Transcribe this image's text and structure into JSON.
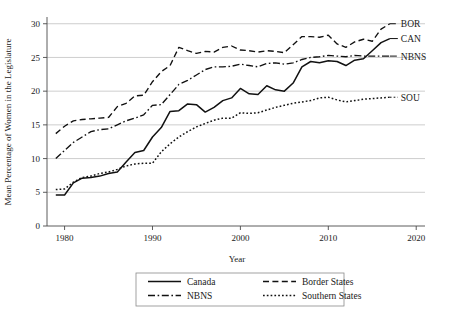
{
  "chart_data": {
    "type": "line",
    "title": "",
    "xlabel": "Year",
    "ylabel": "Mean Percentage of Women in the Legislature",
    "xlim": [
      1978,
      2021
    ],
    "ylim": [
      0,
      31
    ],
    "xticks": [
      1980,
      1990,
      2000,
      2010,
      2020
    ],
    "yticks": [
      0,
      5,
      10,
      15,
      20,
      25,
      30
    ],
    "grid": "horizontal",
    "legend_position": "below-axes",
    "x": [
      1979,
      1980,
      1981,
      1982,
      1983,
      1984,
      1985,
      1986,
      1987,
      1988,
      1989,
      1990,
      1991,
      1992,
      1993,
      1994,
      1995,
      1996,
      1997,
      1998,
      1999,
      2000,
      2001,
      2002,
      2003,
      2004,
      2005,
      2006,
      2007,
      2008,
      2009,
      2010,
      2011,
      2012,
      2013,
      2014,
      2015,
      2016,
      2017
    ],
    "series": [
      {
        "name": "Canada",
        "key": "CAN",
        "style": "solid",
        "end_label": "CAN",
        "values": [
          4.6,
          4.6,
          6.4,
          7.1,
          7.2,
          7.4,
          7.8,
          8.0,
          9.5,
          10.9,
          11.2,
          13.2,
          14.6,
          17.0,
          17.1,
          18.1,
          18.0,
          16.9,
          17.6,
          18.6,
          19.0,
          20.4,
          19.6,
          19.5,
          20.8,
          20.2,
          20.0,
          21.2,
          23.6,
          24.4,
          24.2,
          24.5,
          24.4,
          23.8,
          24.6,
          24.8,
          26.0,
          27.2,
          27.8
        ]
      },
      {
        "name": "Border States",
        "key": "BOR",
        "style": "dashed",
        "end_label": "BOR",
        "values": [
          13.7,
          14.8,
          15.6,
          15.8,
          15.9,
          16.0,
          16.1,
          17.7,
          18.2,
          19.3,
          19.4,
          21.4,
          22.9,
          23.8,
          26.5,
          26.0,
          25.6,
          25.9,
          25.8,
          26.5,
          26.7,
          26.1,
          26.0,
          25.8,
          26.0,
          25.9,
          25.7,
          26.9,
          28.1,
          28.1,
          28.0,
          28.3,
          27.0,
          26.5,
          27.3,
          27.7,
          27.4,
          29.2,
          30.0
        ]
      },
      {
        "name": "NBNS",
        "key": "NBNS",
        "style": "dashdot",
        "end_label": "NBNS",
        "values": [
          10.0,
          11.2,
          12.4,
          13.2,
          14.0,
          14.3,
          14.4,
          15.0,
          15.6,
          16.0,
          16.5,
          17.9,
          18.0,
          19.5,
          21.0,
          21.6,
          22.4,
          23.2,
          23.6,
          23.6,
          23.7,
          24.0,
          23.8,
          23.6,
          24.1,
          24.2,
          24.0,
          24.2,
          24.7,
          25.0,
          25.1,
          25.3,
          25.2,
          25.1,
          25.3,
          25.2,
          25.2,
          25.2,
          25.2
        ]
      },
      {
        "name": "Southern States",
        "key": "SOU",
        "style": "dotted",
        "end_label": "SOU",
        "values": [
          5.4,
          5.5,
          6.5,
          7.2,
          7.4,
          7.8,
          8.0,
          8.4,
          8.9,
          9.2,
          9.3,
          9.3,
          11.0,
          12.2,
          13.2,
          14.0,
          14.7,
          15.2,
          15.7,
          16.0,
          16.0,
          16.8,
          16.7,
          16.8,
          17.2,
          17.6,
          17.9,
          18.2,
          18.4,
          18.6,
          19.0,
          19.1,
          18.7,
          18.4,
          18.6,
          18.8,
          18.9,
          19.0,
          19.1
        ]
      }
    ],
    "legend": [
      {
        "label": "Canada",
        "style": "solid"
      },
      {
        "label": "Border States",
        "style": "dashed"
      },
      {
        "label": "NBNS",
        "style": "dashdot"
      },
      {
        "label": "Southern States",
        "style": "dotted"
      }
    ]
  },
  "colors": {
    "line": "#111111",
    "grid": "#b9b9b9",
    "axis": "#4a4a4a",
    "background": "#ffffff"
  }
}
